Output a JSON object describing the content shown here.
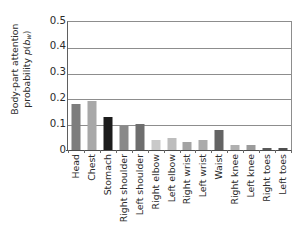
{
  "chart_data": {
    "type": "bar",
    "title": "",
    "xlabel": "",
    "ylabel": "Body-part attention probability p(b_w)",
    "ylabel_line1": "Body-part attention",
    "ylabel_line2_prefix": "probability ",
    "ylabel_line2_italic": "p",
    "ylabel_line2_paren_open": "(",
    "ylabel_line2_var": "b",
    "ylabel_line2_sub": "w",
    "ylabel_line2_paren_close": ")",
    "categories": [
      "Head",
      "Chest",
      "Stomach",
      "Right shoulder",
      "Left shoulder",
      "Right elbow",
      "Left elbow",
      "Right wrist",
      "Left wrist",
      "Waist",
      "Right knee",
      "Left knee",
      "Right toes",
      "Left toes"
    ],
    "values": [
      0.178,
      0.191,
      0.129,
      0.093,
      0.1,
      0.039,
      0.046,
      0.033,
      0.038,
      0.079,
      0.018,
      0.021,
      0.007,
      0.007
    ],
    "bar_colors": [
      "#7d7d7d",
      "#a8a8a8",
      "#1c1c1c",
      "#898989",
      "#6e6e6e",
      "#c9c9c9",
      "#bdbdbd",
      "#a3a3a3",
      "#ababab",
      "#646464",
      "#b0b0b0",
      "#9b9b9b",
      "#5a5a5a",
      "#4f4f4f"
    ],
    "ylim": [
      0,
      0.5
    ],
    "yticks": [
      "0",
      "0.1",
      "0.2",
      "0.3",
      "0.4",
      "0.5"
    ],
    "ytick_values": [
      0,
      0.1,
      0.2,
      0.3,
      0.4,
      0.5
    ],
    "grid": true,
    "legend": "none",
    "axis_color": "#8d8d8d",
    "text_color": "#2b2b2b"
  }
}
